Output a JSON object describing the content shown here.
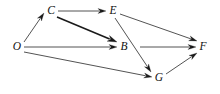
{
  "diagram": {
    "type": "directed-graph",
    "title": "",
    "background_color": "#ffffff",
    "line_color": "#1a1a1a",
    "label_color": "#111111",
    "label_style": "italic-serif",
    "width": 220,
    "height": 94,
    "nodes": [
      {
        "id": "O",
        "label": "O",
        "x": 17,
        "y": 47
      },
      {
        "id": "C",
        "label": "C",
        "x": 51,
        "y": 11
      },
      {
        "id": "E",
        "label": "E",
        "x": 113,
        "y": 11
      },
      {
        "id": "B",
        "label": "B",
        "x": 124,
        "y": 47
      },
      {
        "id": "G",
        "label": "G",
        "x": 159,
        "y": 78
      },
      {
        "id": "F",
        "label": "F",
        "x": 203,
        "y": 47
      }
    ],
    "edges": [
      {
        "id": "O-C",
        "from": "O",
        "to": "C",
        "x1": 24,
        "y1": 42,
        "x2": 44,
        "y2": 13,
        "weight": "thin"
      },
      {
        "id": "C-E",
        "from": "C",
        "to": "E",
        "x1": 58,
        "y1": 11,
        "x2": 106,
        "y2": 11,
        "weight": "thin"
      },
      {
        "id": "C-B",
        "from": "C",
        "to": "B",
        "x1": 57,
        "y1": 17,
        "x2": 117,
        "y2": 42,
        "weight": "thick"
      },
      {
        "id": "O-B",
        "from": "O",
        "to": "B",
        "x1": 24,
        "y1": 47,
        "x2": 117,
        "y2": 47,
        "weight": "thin"
      },
      {
        "id": "O-G",
        "from": "O",
        "to": "G",
        "x1": 24,
        "y1": 52,
        "x2": 152,
        "y2": 77,
        "weight": "thin"
      },
      {
        "id": "E-F",
        "from": "E",
        "to": "F",
        "x1": 120,
        "y1": 14,
        "x2": 197,
        "y2": 41,
        "weight": "thin"
      },
      {
        "id": "E-G",
        "from": "E",
        "to": "G",
        "x1": 115,
        "y1": 18,
        "x2": 151,
        "y2": 72,
        "weight": "thin"
      },
      {
        "id": "B-F",
        "from": "B",
        "to": "F",
        "x1": 140,
        "y1": 47,
        "x2": 196,
        "y2": 47,
        "weight": "thin"
      },
      {
        "id": "G-F",
        "from": "G",
        "to": "F",
        "x1": 166,
        "y1": 74,
        "x2": 197,
        "y2": 53,
        "weight": "thin"
      }
    ]
  }
}
